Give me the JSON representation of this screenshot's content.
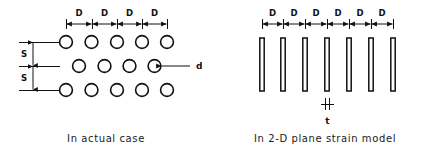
{
  "figure": {
    "background_color": "#ffffff",
    "line_color": "#111111",
    "panels": [
      {
        "id": "actual-case",
        "caption": "In actual case",
        "dimension_label_horizontal": "D",
        "dimension_label_vertical": "S",
        "diameter_label": "d",
        "horizontal_segment_count": 4,
        "vertical_segment_count": 2,
        "rows": [
          {
            "circle_count": 5,
            "offset": false
          },
          {
            "circle_count": 4,
            "offset": true
          },
          {
            "circle_count": 5,
            "offset": false
          }
        ]
      },
      {
        "id": "plane-strain-model",
        "caption": "In 2-D plane strain model",
        "dimension_label_horizontal": "D",
        "thickness_label": "t",
        "horizontal_segment_count": 6,
        "bar_count": 7
      }
    ]
  },
  "labels": {
    "d_left_1": "D",
    "d_left_2": "D",
    "d_left_3": "D",
    "d_left_4": "D",
    "s_upper": "S",
    "s_lower": "S",
    "diameter": "d",
    "d_right_1": "D",
    "d_right_2": "D",
    "d_right_3": "D",
    "d_right_4": "D",
    "d_right_5": "D",
    "d_right_6": "D",
    "thickness": "t",
    "caption_left": "In actual case",
    "caption_right": "In 2-D plane strain model"
  }
}
